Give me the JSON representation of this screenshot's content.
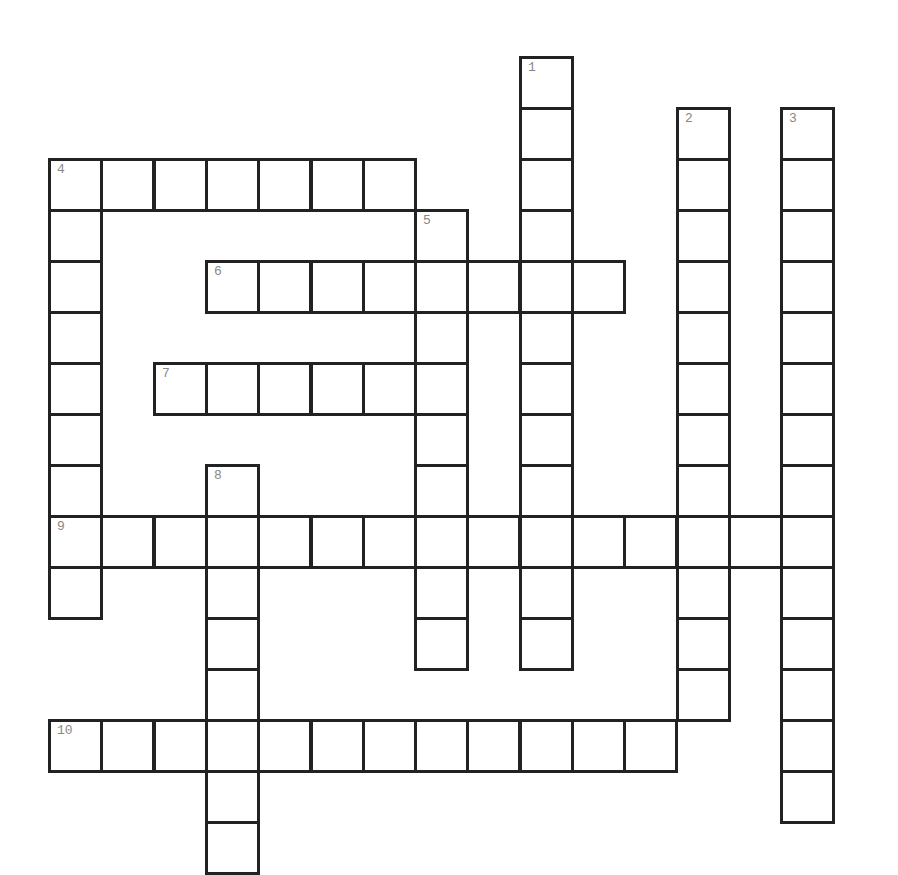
{
  "puzzle": {
    "grid_origin": {
      "x": 48,
      "y": 56
    },
    "cell_w": 52.3,
    "cell_h": 51.0,
    "border_color": "#222222",
    "number_color": "#888888",
    "words": [
      {
        "number": "1",
        "direction": "down",
        "row": 0,
        "col": 9,
        "length": 12
      },
      {
        "number": "2",
        "direction": "down",
        "row": 1,
        "col": 12,
        "length": 12
      },
      {
        "number": "3",
        "direction": "down",
        "row": 1,
        "col": 14,
        "length": 14
      },
      {
        "number": "4",
        "direction": "across",
        "row": 2,
        "col": 0,
        "length": 7
      },
      {
        "number": "4",
        "direction": "down",
        "row": 2,
        "col": 0,
        "length": 9
      },
      {
        "number": "5",
        "direction": "down",
        "row": 3,
        "col": 7,
        "length": 9
      },
      {
        "number": "6",
        "direction": "across",
        "row": 4,
        "col": 3,
        "length": 8
      },
      {
        "number": "7",
        "direction": "across",
        "row": 6,
        "col": 2,
        "length": 6
      },
      {
        "number": "8",
        "direction": "down",
        "row": 8,
        "col": 3,
        "length": 8
      },
      {
        "number": "9",
        "direction": "across",
        "row": 9,
        "col": 0,
        "length": 15
      },
      {
        "number": "10",
        "direction": "across",
        "row": 13,
        "col": 0,
        "length": 12
      }
    ]
  }
}
